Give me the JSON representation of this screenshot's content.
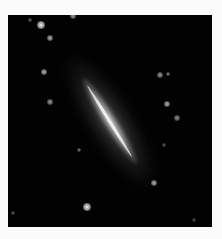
{
  "image": {
    "subject": "edge-on spiral galaxy",
    "background_color": "#020202",
    "border_color": "#fbfbfb",
    "galaxy": {
      "center_x": 102,
      "center_y": 105,
      "angle_deg": 58,
      "core_color": "#f0f0f0"
    },
    "stars": [
      {
        "x": 33,
        "y": 10,
        "r": 4,
        "brightness": 0.95
      },
      {
        "x": 42,
        "y": 23,
        "r": 3,
        "brightness": 0.7
      },
      {
        "x": 36,
        "y": 57,
        "r": 3,
        "brightness": 0.7
      },
      {
        "x": 42,
        "y": 87,
        "r": 3,
        "brightness": 0.6
      },
      {
        "x": 22,
        "y": 5,
        "r": 2,
        "brightness": 0.4
      },
      {
        "x": 65,
        "y": 1,
        "r": 3,
        "brightness": 0.6
      },
      {
        "x": 152,
        "y": 60,
        "r": 3,
        "brightness": 0.6
      },
      {
        "x": 160,
        "y": 59,
        "r": 2,
        "brightness": 0.5
      },
      {
        "x": 159,
        "y": 89,
        "r": 3,
        "brightness": 0.7
      },
      {
        "x": 169,
        "y": 103,
        "r": 3,
        "brightness": 0.55
      },
      {
        "x": 146,
        "y": 168,
        "r": 3,
        "brightness": 0.7
      },
      {
        "x": 79,
        "y": 192,
        "r": 4,
        "brightness": 0.95
      },
      {
        "x": 71,
        "y": 135,
        "r": 2,
        "brightness": 0.45
      },
      {
        "x": 5,
        "y": 198,
        "r": 2,
        "brightness": 0.35
      },
      {
        "x": 156,
        "y": 130,
        "r": 2,
        "brightness": 0.35
      },
      {
        "x": 186,
        "y": 205,
        "r": 2,
        "brightness": 0.3
      }
    ]
  }
}
